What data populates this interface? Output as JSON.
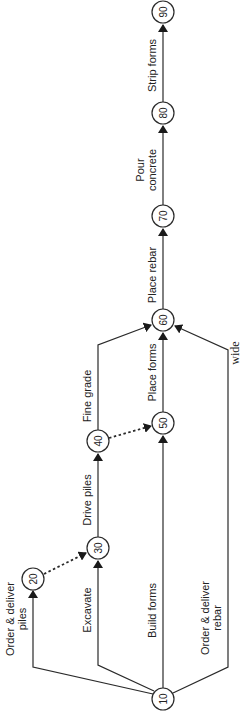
{
  "diagram": {
    "type": "activity-on-arrow network (rotated)",
    "colors": {
      "line": "#2a2a2a",
      "background": "#ffffff"
    },
    "nodes": [
      {
        "id": "10",
        "label": "10"
      },
      {
        "id": "20",
        "label": "20"
      },
      {
        "id": "30",
        "label": "30"
      },
      {
        "id": "40",
        "label": "40"
      },
      {
        "id": "50",
        "label": "50"
      },
      {
        "id": "60",
        "label": "60"
      },
      {
        "id": "70",
        "label": "70"
      },
      {
        "id": "80",
        "label": "80"
      },
      {
        "id": "90",
        "label": "90"
      }
    ],
    "activities": [
      {
        "from": "10",
        "to": "20",
        "line1": "Order & deliver",
        "line2": "piles",
        "dummy": false
      },
      {
        "from": "10",
        "to": "30",
        "line1": "Excavate",
        "dummy": false
      },
      {
        "from": "10",
        "to": "50",
        "line1": "Build forms",
        "dummy": false
      },
      {
        "from": "10",
        "to": "60",
        "line1": "Order & deliver",
        "line2": "rebar",
        "dummy": false
      },
      {
        "from": "20",
        "to": "30",
        "dummy": true
      },
      {
        "from": "30",
        "to": "40",
        "line1": "Drive piles",
        "dummy": false
      },
      {
        "from": "40",
        "to": "50",
        "dummy": true
      },
      {
        "from": "40",
        "to": "60",
        "line1": "Fine grade",
        "dummy": false
      },
      {
        "from": "50",
        "to": "60",
        "line1": "Place forms",
        "dummy": false
      },
      {
        "from": "60",
        "to": "70",
        "line1": "Place rebar",
        "dummy": false
      },
      {
        "from": "70",
        "to": "80",
        "line1": "Pour",
        "line2": "concrete",
        "dummy": false
      },
      {
        "from": "80",
        "to": "90",
        "line1": "Strip forms",
        "dummy": false
      }
    ],
    "annotation": "wide"
  }
}
